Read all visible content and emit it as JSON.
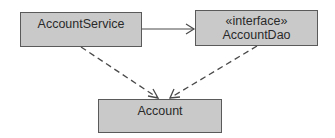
{
  "diagram": {
    "type": "uml-class-diagram",
    "nodes": [
      {
        "id": "account_service",
        "label": "AccountService",
        "stereotype": ""
      },
      {
        "id": "account_dao",
        "label": "AccountDao",
        "stereotype": "«interface»"
      },
      {
        "id": "account",
        "label": "Account",
        "stereotype": ""
      }
    ],
    "edges": [
      {
        "from": "account_service",
        "to": "account_dao",
        "style": "solid",
        "arrow": "open"
      },
      {
        "from": "account_service",
        "to": "account",
        "style": "dashed",
        "arrow": "open"
      },
      {
        "from": "account_dao",
        "to": "account",
        "style": "dashed",
        "arrow": "open"
      }
    ],
    "colors": {
      "box_fill": "#c9c9c9",
      "box_border": "#5a5a5a",
      "line": "#4a4a4a",
      "text": "#2a2a2a"
    }
  }
}
